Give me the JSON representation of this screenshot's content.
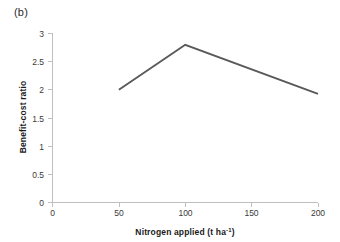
{
  "figure": {
    "panel_label": "(b)",
    "background": "#ffffff"
  },
  "chart_data": {
    "type": "line",
    "title": "",
    "subtitle": "",
    "xlabel": "Nitrogen applied (t ha",
    "xlabel_sup": "-1",
    "xlabel_tail": ")",
    "xlabel_full": "Nitrogen applied (t ha⁻¹)",
    "ylabel": "Benefit-cost ratio",
    "x": [
      50,
      100,
      200
    ],
    "values": [
      2.0,
      2.8,
      1.93
    ],
    "series": [
      {
        "name": "Benefit-cost ratio",
        "x": [
          50,
          100,
          200
        ],
        "values": [
          2.0,
          2.8,
          1.93
        ],
        "color": "#595959"
      }
    ],
    "xlim": [
      0,
      200
    ],
    "ylim": [
      0,
      3
    ],
    "xticks": [
      0,
      50,
      100,
      150,
      200
    ],
    "xtick_labels": [
      "0",
      "50",
      "100",
      "150",
      "200"
    ],
    "yticks": [
      0,
      0.5,
      1,
      1.5,
      2,
      2.5,
      3
    ],
    "ytick_labels": [
      "0",
      "0.5",
      "1",
      "1.5",
      "2",
      "2.5",
      "3"
    ],
    "grid": false,
    "legend": false,
    "legend_position": "none",
    "line_color": "#595959",
    "axis_color": "#bfbfbf",
    "annotations": []
  }
}
